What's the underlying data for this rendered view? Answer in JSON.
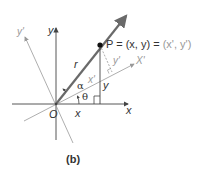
{
  "figure": {
    "caption": "(b)",
    "labels": {
      "y_axis": "y",
      "x_axis": "x",
      "y_prime_axis": "y'",
      "x_prime_axis": "X'",
      "origin": "O",
      "radius": "r",
      "alpha": "α",
      "theta": "θ",
      "x_prime_segment": "x'",
      "y_prime_segment": "y'",
      "x_segment": "x",
      "y_segment": "y"
    },
    "point_label": {
      "main": "P = (x, y) = ",
      "rotated": "(x', y')"
    },
    "colors": {
      "axis": "#444444",
      "radius": "#6a6a6a",
      "rotated_axis": "#9a9a9a",
      "text_dark": "#333333",
      "text_light": "#999999"
    }
  }
}
